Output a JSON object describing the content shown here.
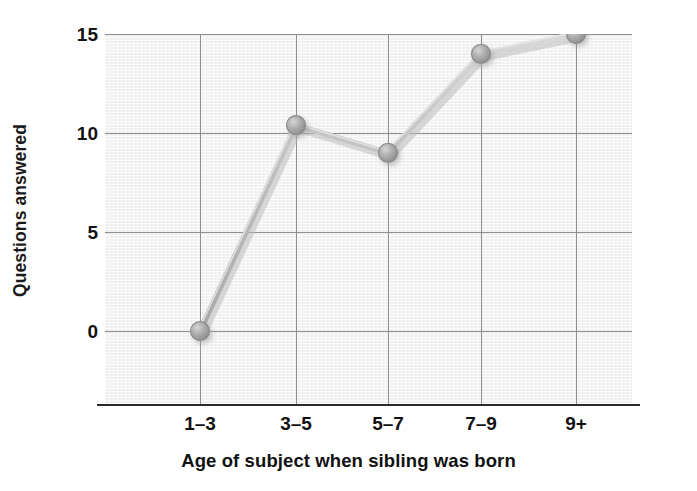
{
  "chart_data": {
    "type": "line",
    "title": "",
    "xlabel": "Age of subject when sibling was born",
    "ylabel": "Questions answered",
    "categories": [
      "1–3",
      "3–5",
      "5–7",
      "7–9",
      "9+"
    ],
    "values": [
      0,
      10.4,
      9,
      14,
      15
    ],
    "series": [
      {
        "name": "Questions answered",
        "values": [
          0,
          10.4,
          9,
          14,
          15
        ]
      }
    ],
    "yticks": [
      0,
      5,
      10,
      15
    ],
    "ytick_labels": [
      "0",
      "5",
      "10",
      "15"
    ],
    "ylim": [
      -2.5,
      15.8
    ],
    "xlim": [
      0,
      6
    ],
    "grid": true,
    "legend": "none",
    "marker": "circle",
    "colors": {
      "plot_background": "#efeff0",
      "gridline": "#8e8e8e",
      "axis": "#2b2b2b",
      "line": "#b9b9b9",
      "marker_fill": "#a8a8a8",
      "marker_edge": "#8a8a8a",
      "text": "#111111",
      "page_background": "#ffffff"
    }
  }
}
